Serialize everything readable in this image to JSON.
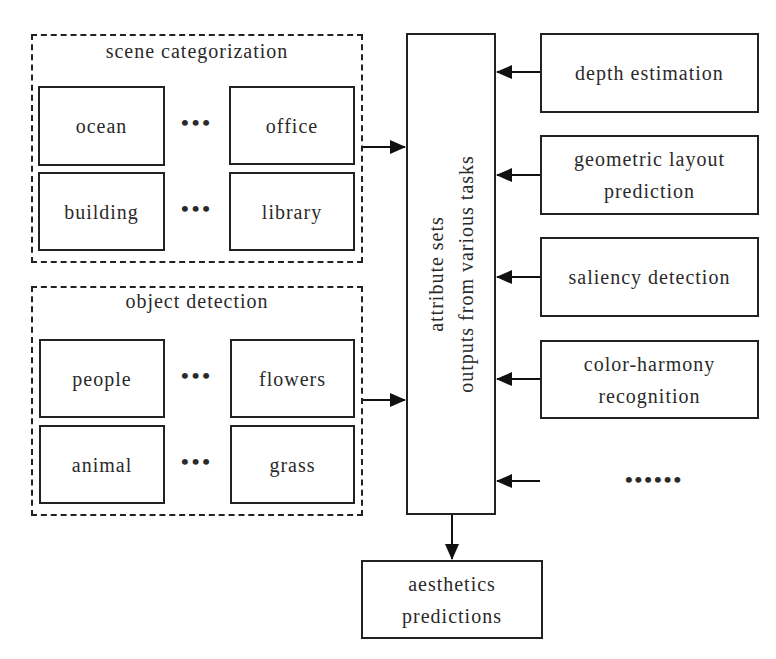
{
  "groups": {
    "scene": {
      "title": "scene categorization",
      "items": [
        "ocean",
        "office",
        "building",
        "library"
      ],
      "ellipsis": "•••"
    },
    "object": {
      "title": "object detection",
      "items": [
        "people",
        "flowers",
        "animal",
        "grass"
      ],
      "ellipsis": "•••"
    }
  },
  "center": {
    "line1": "attribute sets",
    "line2": "outputs from various tasks"
  },
  "tasks": [
    {
      "line1": "depth estimation",
      "line2": ""
    },
    {
      "line1": "geometric layout",
      "line2": "prediction"
    },
    {
      "line1": "saliency detection",
      "line2": ""
    },
    {
      "line1": "color-harmony",
      "line2": "recognition"
    }
  ],
  "more_tasks": "••••••",
  "output": {
    "line1": "aesthetics",
    "line2": "predictions"
  }
}
